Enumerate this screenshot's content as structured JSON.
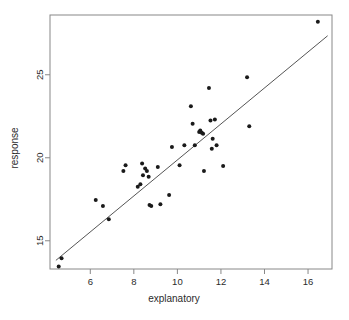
{
  "chart_data": {
    "type": "scatter",
    "title": "",
    "subtitle": "",
    "xlabel": "explanatory",
    "ylabel": "response",
    "xlim": [
      4.15,
      17.1
    ],
    "ylim": [
      13.3,
      28.6
    ],
    "xticks": [
      6,
      8,
      10,
      12,
      14,
      16
    ],
    "yticks": [
      15,
      20,
      25
    ],
    "xtick_labels": [
      "6",
      "8",
      "10",
      "12",
      "14",
      "16"
    ],
    "ytick_labels": [
      "15",
      "20",
      "25"
    ],
    "grid": false,
    "legend": null,
    "legend_position": "none",
    "annotations": [],
    "point_color": "#1a1a1a",
    "point_size": 2.0,
    "line_color": "#555555",
    "background_color": "#ffffff",
    "box_color": "#888888",
    "x": [
      4.55,
      4.68,
      6.25,
      6.58,
      6.85,
      7.52,
      7.62,
      8.18,
      8.3,
      8.38,
      8.42,
      8.52,
      8.6,
      8.68,
      8.72,
      8.8,
      9.1,
      9.22,
      9.62,
      9.75,
      10.1,
      10.32,
      10.62,
      10.7,
      10.8,
      11.0,
      11.05,
      11.12,
      11.18,
      11.22,
      11.45,
      11.52,
      11.58,
      11.62,
      11.72,
      11.8,
      12.1,
      13.2,
      13.3,
      16.45
    ],
    "y": [
      13.45,
      13.95,
      17.45,
      17.1,
      16.3,
      19.2,
      19.55,
      18.25,
      18.4,
      19.65,
      18.95,
      19.35,
      19.2,
      18.85,
      17.15,
      17.1,
      19.45,
      17.2,
      17.75,
      20.65,
      19.55,
      20.75,
      23.1,
      22.05,
      20.75,
      21.55,
      21.65,
      21.5,
      21.45,
      19.2,
      24.2,
      22.25,
      20.55,
      21.15,
      22.3,
      20.75,
      19.5,
      24.85,
      21.9,
      28.2
    ],
    "regression_line": {
      "type": "linear-fit",
      "x_start": 4.42,
      "y_start": 13.82,
      "x_end": 16.9,
      "y_end": 27.35,
      "slope": 1.084,
      "intercept": 9.03
    }
  },
  "axes": {
    "x_title": "explanatory",
    "y_title": "response"
  }
}
